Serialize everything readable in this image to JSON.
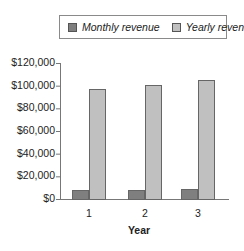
{
  "chart_data": {
    "type": "bar",
    "title": "",
    "xlabel": "Year",
    "ylabel": "",
    "categories": [
      "1",
      "2",
      "3"
    ],
    "series": [
      {
        "name": "Monthly revenue",
        "color": "#7f7f7f",
        "values": [
          8000,
          8300,
          8700
        ]
      },
      {
        "name": "Yearly revenue",
        "color": "#c0c0c0",
        "values": [
          97000,
          101000,
          105000
        ]
      }
    ],
    "ylim": [
      0,
      120000
    ],
    "yticks": [
      "$0",
      "$20,000",
      "$40,000",
      "$60,000",
      "$80,000",
      "$100,000",
      "$120,000"
    ],
    "grid": false,
    "legend_position": "top"
  },
  "legend": {
    "items": [
      {
        "label": "Monthly revenue",
        "color": "#7f7f7f"
      },
      {
        "label": "Yearly revenue",
        "color": "#c0c0c0"
      }
    ]
  }
}
